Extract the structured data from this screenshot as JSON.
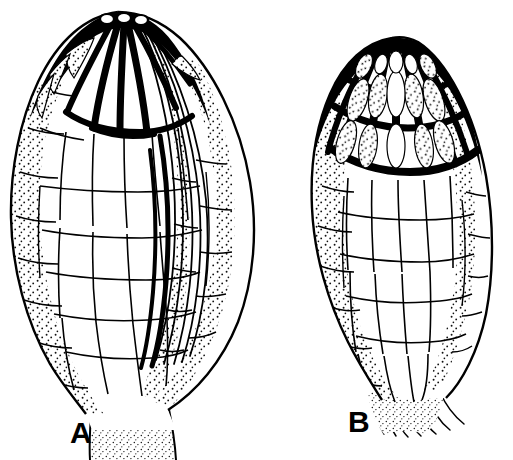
{
  "figure": {
    "kind": "botanical-line-drawing",
    "medium": "ink-stipple",
    "background_color": "#ffffff",
    "ink_color": "#000000",
    "width": 513,
    "height": 460,
    "specimen_count": 2
  },
  "specimens": [
    {
      "id": "A",
      "label": "A",
      "label_x": 70,
      "label_y": 443,
      "description": "ovate leaf with three apical white papillae, bold black apical cell walls, stippled marginal cells, long striate flank on right side, tapering basal stalk",
      "outline": "M 118 12 C 86 16, 58 40, 38 82 C 20 120, 10 170, 11 218 C 12 268, 26 322, 50 364 C 62 384, 74 398, 86 414 L 92 460 L 176 460 L 168 410 C 196 392, 222 362, 238 322 C 254 280, 258 230, 250 182 C 240 122, 212 68, 180 38 C 162 22, 140 12, 118 12 Z",
      "apex_band": "M 118 12 C 98 16, 76 34, 60 58 C 72 46, 92 34, 112 30 C 134 26, 156 34, 172 48 C 158 28, 140 14, 118 12 Z",
      "apical_papillae": [
        {
          "cx": 107,
          "cy": 19,
          "rx": 7,
          "ry": 5
        },
        {
          "cx": 124,
          "cy": 18,
          "rx": 7,
          "ry": 5
        },
        {
          "cx": 141,
          "cy": 20,
          "rx": 7,
          "ry": 5
        }
      ]
    },
    {
      "id": "B",
      "label": "B",
      "label_x": 348,
      "label_y": 432,
      "description": "narrower obovate leaf with heavily thickened black apical reticulum of elongate radiating cells, stippled margins, clear interior cells, basal stalk of fine fibers",
      "outline": "M 392 38 C 366 42, 344 62, 330 94 C 316 126, 310 166, 312 208 C 314 254, 328 302, 348 342 C 360 366, 372 384, 382 400 L 388 430 L 440 430 L 446 398 C 462 382, 478 352, 486 314 C 494 272, 494 222, 486 176 C 474 110, 446 60, 418 42 C 410 38, 400 36, 392 38 Z",
      "apex_band": "M 392 38 C 372 42, 352 58, 340 82 C 352 68, 372 56, 392 54 C 414 52, 434 62, 446 78 C 434 54, 414 36, 392 38 Z"
    }
  ]
}
